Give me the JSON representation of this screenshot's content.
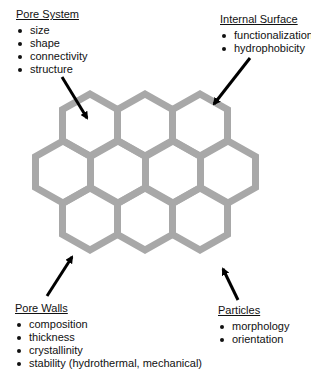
{
  "diagram": {
    "type": "annotated-honeycomb",
    "hexagon_color": "#a8a8a8",
    "arrow_color": "#000000",
    "annotations": [
      {
        "id": "pore-system",
        "title": "Pore System",
        "items": [
          "size",
          "shape",
          "connectivity",
          "structure"
        ]
      },
      {
        "id": "internal-surface",
        "title": "Internal Surface",
        "items": [
          "functionalization",
          "hydrophobicity"
        ]
      },
      {
        "id": "pore-walls",
        "title": "Pore Walls",
        "items": [
          "composition",
          "thickness",
          "crystallinity",
          "stability (hydrothermal, mechanical)"
        ]
      },
      {
        "id": "particles",
        "title": "Particles",
        "items": [
          "morphology",
          "orientation"
        ]
      }
    ],
    "hex_grid": {
      "rows": [
        3,
        4,
        3
      ]
    }
  }
}
